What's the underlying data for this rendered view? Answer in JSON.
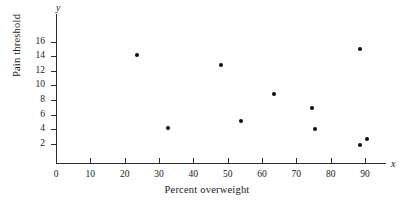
{
  "chart_data": {
    "type": "scatter",
    "title": "",
    "xlabel": "Percent overweight",
    "ylabel": "Pain threshold",
    "x_axis_symbol": "x",
    "y_axis_symbol": "y",
    "xlim": [
      0,
      96
    ],
    "ylim": [
      0,
      17
    ],
    "xticks": [
      0,
      10,
      20,
      30,
      40,
      50,
      60,
      70,
      80,
      90
    ],
    "xticklabels": [
      "0",
      "10",
      "20",
      "30",
      "40",
      "50",
      "60",
      "70",
      "80",
      "90"
    ],
    "yticks": [
      2,
      4,
      6,
      8,
      10,
      12,
      14,
      16
    ],
    "yticklabels": [
      "2",
      "4",
      "6",
      "8",
      "10",
      "12",
      "14",
      "16"
    ],
    "grid": false,
    "legend": false,
    "marker": "filled-circle",
    "marker_color": "#0d0d0d",
    "axis_color": "#2b2b2b",
    "points": [
      {
        "x": 23.5,
        "y": 14.1
      },
      {
        "x": 32.5,
        "y": 4.2
      },
      {
        "x": 48.0,
        "y": 12.8
      },
      {
        "x": 54.0,
        "y": 5.1
      },
      {
        "x": 63.5,
        "y": 8.8
      },
      {
        "x": 74.5,
        "y": 6.9
      },
      {
        "x": 75.5,
        "y": 4.0
      },
      {
        "x": 88.5,
        "y": 15.0
      },
      {
        "x": 88.5,
        "y": 1.8
      },
      {
        "x": 90.5,
        "y": 2.7
      }
    ]
  }
}
